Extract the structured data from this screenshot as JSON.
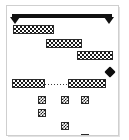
{
  "screen": {
    "width": 129,
    "height": 140,
    "title": "Platformer Level View",
    "background_color": "#ffffff",
    "frame_color": "#cfcfcf"
  },
  "palette": {
    "ink": "#1a1a1a",
    "rail": "#111111",
    "diamond": "#0d0d0d",
    "checker_light": "#ffffff",
    "checker_dark": "#1a1a1a",
    "bridge": "#3a3a3a"
  },
  "playfield": {
    "left": 7,
    "top": 6,
    "width": 111,
    "height": 129,
    "label": "playfield"
  },
  "rail": {
    "label": "ceiling-rail",
    "x": 5,
    "y": 8,
    "width": 100,
    "height": 4,
    "left_cap": {
      "x": 3,
      "y": 11,
      "label": "left-arrow-cap"
    },
    "right_cap": {
      "x": 97,
      "y": 11,
      "label": "right-arrow-cap"
    }
  },
  "platforms": [
    {
      "id": "platform-1",
      "label": "Platform 1",
      "x": 6,
      "y": 19,
      "width": 41,
      "height": 9
    },
    {
      "id": "platform-2",
      "label": "Platform 2",
      "x": 39,
      "y": 33,
      "width": 36,
      "height": 9
    },
    {
      "id": "platform-3",
      "label": "Platform 3",
      "x": 70,
      "y": 45,
      "width": 36,
      "height": 9
    },
    {
      "id": "platform-4",
      "label": "Platform 4",
      "x": 5,
      "y": 73,
      "width": 33,
      "height": 9
    },
    {
      "id": "platform-5",
      "label": "Platform 5",
      "x": 61,
      "y": 73,
      "width": 38,
      "height": 9
    }
  ],
  "bridge": {
    "label": "dotted-bridge",
    "x": 38,
    "y": 78,
    "width": 24,
    "style": "dotted"
  },
  "diamond": {
    "label": "diamond-collectible",
    "x": 99,
    "y": 62,
    "size": 8
  },
  "blocks": [
    {
      "id": "block-1",
      "label": "Block 1",
      "x": 31,
      "y": 90,
      "size": 8
    },
    {
      "id": "block-2",
      "label": "Block 2",
      "x": 54,
      "y": 90,
      "size": 8
    },
    {
      "id": "block-3",
      "label": "Block 3",
      "x": 74,
      "y": 90,
      "size": 8
    },
    {
      "id": "block-4",
      "label": "Block 4",
      "x": 31,
      "y": 103,
      "size": 8
    },
    {
      "id": "block-5",
      "label": "Block 5",
      "x": 54,
      "y": 116,
      "size": 8
    },
    {
      "id": "block-6",
      "label": "Block 6",
      "x": 74,
      "y": 128,
      "size": 8
    }
  ]
}
